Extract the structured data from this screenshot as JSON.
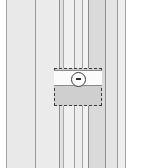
{
  "drawing": {
    "title": "Vertical Board Siding Elevation Detail",
    "width": 151,
    "height": 168,
    "background_color": "#ffffff",
    "left_margin": {
      "x": 0,
      "width": 6,
      "color": "#ffffff"
    },
    "right_margin": {
      "x": 126,
      "width": 25,
      "color": "#ffffff"
    },
    "boards": [
      {
        "name": "board-1",
        "x": 6,
        "width": 30,
        "color": "#e9e9e9"
      },
      {
        "name": "board-2",
        "x": 36,
        "width": 24,
        "color": "#ebebeb"
      },
      {
        "name": "board-3",
        "x": 60,
        "width": 4,
        "color": "#e2e2e2"
      },
      {
        "name": "board-4",
        "x": 64,
        "width": 11,
        "color": "#f0f0f0"
      },
      {
        "name": "board-5",
        "x": 75,
        "width": 8,
        "color": "#ededed"
      },
      {
        "name": "board-6",
        "x": 83,
        "width": 6,
        "color": "#f2f2f2"
      },
      {
        "name": "board-7",
        "x": 89,
        "width": 17,
        "color": "#dadada"
      },
      {
        "name": "board-8",
        "x": 106,
        "width": 12,
        "color": "#e4e4e4"
      },
      {
        "name": "board-9",
        "x": 118,
        "width": 8,
        "color": "#eeeeee"
      }
    ],
    "joint_lines": [
      {
        "name": "joint-line-1",
        "x": 6,
        "color": "#a0a0a0"
      },
      {
        "name": "joint-line-2",
        "x": 35,
        "color": "#9a9a9a"
      },
      {
        "name": "joint-line-3",
        "x": 59,
        "color": "#8f8f8f"
      },
      {
        "name": "joint-line-4",
        "x": 63,
        "color": "#a8a8a8"
      },
      {
        "name": "joint-line-5",
        "x": 74,
        "color": "#9e9e9e"
      },
      {
        "name": "joint-line-6",
        "x": 82,
        "color": "#a5a5a5"
      },
      {
        "name": "joint-line-7",
        "x": 88,
        "color": "#8c8c8c"
      },
      {
        "name": "joint-line-8",
        "x": 105,
        "color": "#909090"
      },
      {
        "name": "joint-line-9",
        "x": 117,
        "color": "#9c9c9c"
      },
      {
        "name": "joint-line-10",
        "x": 125,
        "color": "#a3a3a3"
      }
    ],
    "detail_callout": {
      "name": "dashed-detail-rectangle",
      "x": 54,
      "y": 68,
      "width": 48,
      "height": 38,
      "fill_color": "#cfcfcf",
      "border_style": "dashed",
      "border_color": "#3b3b3b",
      "white_band": {
        "name": "horizontal-white-band",
        "x": 54,
        "y": 70,
        "width": 48,
        "height": 16,
        "fill_color": "#fbfbfb",
        "edge_color": "#8a8a8a"
      },
      "circle_marker": {
        "name": "circular-fixture-marker",
        "center_x": 78,
        "center_y": 79,
        "diameter": 15,
        "fill_color": "#ffffff",
        "border_color": "#3b3b3b",
        "glyph": "horizontal-dash"
      }
    }
  }
}
